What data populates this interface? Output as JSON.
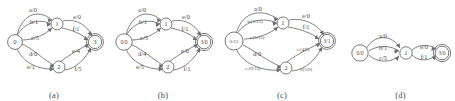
{
  "figure": {
    "type": "finite-state-transducer-diagrams",
    "panel_count": 4
  },
  "panels": [
    {
      "id": "a",
      "caption": "(a)",
      "states": [
        {
          "id": "s0",
          "label": "0",
          "accepting": false,
          "start": true
        },
        {
          "id": "s1",
          "label": "1",
          "accepting": false,
          "start": false
        },
        {
          "id": "s2",
          "label": "2",
          "accepting": false,
          "start": false
        },
        {
          "id": "s3",
          "label": "3",
          "accepting": true,
          "start": false
        }
      ],
      "transitions": [
        {
          "from": "s0",
          "to": "s1",
          "label": "a/0"
        },
        {
          "from": "s0",
          "to": "s1",
          "label": "b/1"
        },
        {
          "from": "s0",
          "to": "s1",
          "label": "c/5"
        },
        {
          "from": "s0",
          "to": "s2",
          "label": "d/0"
        },
        {
          "from": "s0",
          "to": "s2",
          "label": "e/1"
        },
        {
          "from": "s1",
          "to": "s3",
          "label": "e/0"
        },
        {
          "from": "s1",
          "to": "s3",
          "label": "f/1"
        },
        {
          "from": "s2",
          "to": "s3",
          "label": "e/4"
        },
        {
          "from": "s2",
          "to": "s3",
          "label": "f/5"
        }
      ]
    },
    {
      "id": "b",
      "caption": "(b)",
      "states": [
        {
          "id": "s0",
          "label": "0/0",
          "accepting": false,
          "start": true
        },
        {
          "id": "s1",
          "label": "1",
          "accepting": false,
          "start": false
        },
        {
          "id": "s2",
          "label": "2",
          "accepting": false,
          "start": false
        },
        {
          "id": "s3",
          "label": "3/0",
          "accepting": true,
          "start": false
        }
      ],
      "transitions": [
        {
          "from": "s0",
          "to": "s1",
          "label": "a/0"
        },
        {
          "from": "s0",
          "to": "s1",
          "label": "b/1"
        },
        {
          "from": "s0",
          "to": "s1",
          "label": "c/5"
        },
        {
          "from": "s0",
          "to": "s2",
          "label": "d/4"
        },
        {
          "from": "s0",
          "to": "s2",
          "label": "e/5"
        },
        {
          "from": "s1",
          "to": "s3",
          "label": "e/0"
        },
        {
          "from": "s1",
          "to": "s3",
          "label": "f/1"
        },
        {
          "from": "s2",
          "to": "s3",
          "label": "e/0"
        },
        {
          "from": "s2",
          "to": "s3",
          "label": "f/1"
        }
      ]
    },
    {
      "id": "c",
      "caption": "(c)",
      "states": [
        {
          "id": "s0",
          "label": "0/15",
          "accepting": false,
          "start": true
        },
        {
          "id": "s1",
          "label": "1",
          "accepting": false,
          "start": false
        },
        {
          "id": "s2",
          "label": "2",
          "accepting": false,
          "start": false
        },
        {
          "id": "s3",
          "label": "3/1",
          "accepting": true,
          "start": false
        }
      ],
      "transitions": [
        {
          "from": "s0",
          "to": "s1",
          "label": "a/0"
        },
        {
          "from": "s0",
          "to": "s1",
          "label": "b/(1/15)"
        },
        {
          "from": "s0",
          "to": "s1",
          "label": "c/(5/15)"
        },
        {
          "from": "s0",
          "to": "s2",
          "label": "d/0"
        },
        {
          "from": "s0",
          "to": "s2",
          "label": "e/(9/15)"
        },
        {
          "from": "s1",
          "to": "s3",
          "label": "e/0"
        },
        {
          "from": "s1",
          "to": "s3",
          "label": "f/1"
        },
        {
          "from": "s2",
          "to": "s3",
          "label": "e/(4/9)"
        },
        {
          "from": "s2",
          "to": "s3",
          "label": "f/(5/9)"
        }
      ]
    },
    {
      "id": "d",
      "caption": "(d)",
      "states": [
        {
          "id": "s0",
          "label": "0/0",
          "accepting": false,
          "start": true
        },
        {
          "id": "s1",
          "label": "1",
          "accepting": false,
          "start": false
        },
        {
          "id": "s3",
          "label": "3/0",
          "accepting": true,
          "start": false
        }
      ],
      "transitions": [
        {
          "from": "s0",
          "to": "s1",
          "label": "a/0"
        },
        {
          "from": "s0",
          "to": "s1",
          "label": "b/1"
        },
        {
          "from": "s0",
          "to": "s1",
          "label": "c/5"
        },
        {
          "from": "s1",
          "to": "s3",
          "label": "e/0"
        },
        {
          "from": "s1",
          "to": "s3",
          "label": "f/1"
        }
      ]
    }
  ]
}
